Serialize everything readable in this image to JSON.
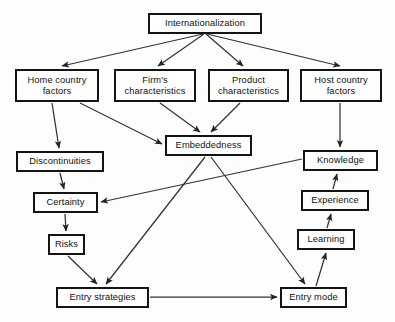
{
  "diagram": {
    "type": "flow-diagram",
    "canvas": {
      "width": 395,
      "height": 322,
      "background": "#fdfdfd"
    },
    "style": {
      "node_border": "#141414",
      "node_fill": "#ffffff",
      "edge_color": "#333333",
      "text_color": "#111111"
    },
    "nodes": [
      {
        "id": "internationalization",
        "label": "Internationalization",
        "x": 148,
        "y": 13,
        "w": 114,
        "h": 21
      },
      {
        "id": "home_country_factors",
        "label": "Home country\nfactors",
        "x": 15,
        "y": 69,
        "w": 84,
        "h": 33
      },
      {
        "id": "firms_characteristics",
        "label": "Firm's\ncharacteristics",
        "x": 114,
        "y": 69,
        "w": 82,
        "h": 33
      },
      {
        "id": "product_characteristics",
        "label": "Product\ncharacteristics",
        "x": 208,
        "y": 69,
        "w": 81,
        "h": 33
      },
      {
        "id": "host_country_factors",
        "label": "Host country\nfactors",
        "x": 300,
        "y": 69,
        "w": 82,
        "h": 33
      },
      {
        "id": "embeddedness",
        "label": "Embeddedness",
        "x": 165,
        "y": 135,
        "w": 87,
        "h": 21
      },
      {
        "id": "discontinuities",
        "label": "Discontinuities",
        "x": 16,
        "y": 151,
        "w": 88,
        "h": 21
      },
      {
        "id": "knowledge",
        "label": "Knowledge",
        "x": 303,
        "y": 150,
        "w": 75,
        "h": 21
      },
      {
        "id": "certainty",
        "label": "Certainty",
        "x": 33,
        "y": 192,
        "w": 65,
        "h": 21
      },
      {
        "id": "experience",
        "label": "Experience",
        "x": 301,
        "y": 190,
        "w": 68,
        "h": 21
      },
      {
        "id": "risks",
        "label": "Risks",
        "x": 48,
        "y": 234,
        "w": 37,
        "h": 21
      },
      {
        "id": "learning",
        "label": "Learning",
        "x": 297,
        "y": 229,
        "w": 58,
        "h": 21
      },
      {
        "id": "entry_strategies",
        "label": "Entry strategies",
        "x": 56,
        "y": 287,
        "w": 93,
        "h": 21
      },
      {
        "id": "entry_mode",
        "label": "Entry mode",
        "x": 280,
        "y": 287,
        "w": 67,
        "h": 21
      }
    ],
    "edges": [
      {
        "from": "internationalization",
        "to": "home_country_factors"
      },
      {
        "from": "internationalization",
        "to": "firms_characteristics"
      },
      {
        "from": "internationalization",
        "to": "product_characteristics"
      },
      {
        "from": "internationalization",
        "to": "host_country_factors"
      },
      {
        "from": "home_country_factors",
        "to": "discontinuities"
      },
      {
        "from": "home_country_factors",
        "to": "embeddedness"
      },
      {
        "from": "firms_characteristics",
        "to": "embeddedness"
      },
      {
        "from": "product_characteristics",
        "to": "embeddedness"
      },
      {
        "from": "host_country_factors",
        "to": "knowledge"
      },
      {
        "from": "discontinuities",
        "to": "certainty"
      },
      {
        "from": "knowledge",
        "to": "certainty"
      },
      {
        "from": "certainty",
        "to": "risks"
      },
      {
        "from": "risks",
        "to": "entry_strategies"
      },
      {
        "from": "embeddedness",
        "to": "entry_strategies"
      },
      {
        "from": "embeddedness",
        "to": "entry_mode"
      },
      {
        "from": "entry_strategies",
        "to": "entry_mode"
      },
      {
        "from": "entry_mode",
        "to": "learning"
      },
      {
        "from": "learning",
        "to": "experience"
      },
      {
        "from": "experience",
        "to": "knowledge"
      }
    ]
  }
}
